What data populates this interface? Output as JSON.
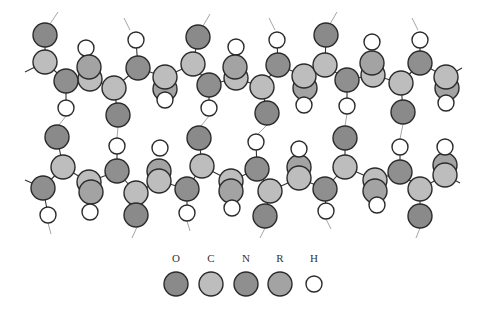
{
  "colors": {
    "O": "#8a8a8a",
    "C": "#bdbdbd",
    "N": "#8f8f8f",
    "R": "#a3a3a3",
    "H": "#ffffff",
    "stroke": "#2b2b2b",
    "bond": "#333333",
    "hbond": "#9a9a9a"
  },
  "legend": {
    "items": [
      {
        "label": "O",
        "x": 176,
        "type": "O"
      },
      {
        "label": "C",
        "x": 211,
        "type": "C"
      },
      {
        "label": "N",
        "x": 246,
        "type": "N"
      },
      {
        "label": "R",
        "x": 280,
        "type": "R"
      },
      {
        "label": "H",
        "x": 314,
        "type": "H"
      }
    ]
  },
  "chains": {
    "top": {
      "atoms": [
        {
          "t": "O",
          "x": 45,
          "y": 35,
          "r": 12
        },
        {
          "t": "C",
          "x": 45,
          "y": 62,
          "r": 12
        },
        {
          "t": "H",
          "x": 86,
          "y": 48,
          "r": 8
        },
        {
          "t": "C",
          "x": 90,
          "y": 79,
          "r": 12
        },
        {
          "t": "R",
          "x": 89,
          "y": 67,
          "r": 12
        },
        {
          "t": "N",
          "x": 66,
          "y": 81,
          "r": 12
        },
        {
          "t": "H",
          "x": 66,
          "y": 108,
          "r": 8
        },
        {
          "t": "C",
          "x": 114,
          "y": 88,
          "r": 12
        },
        {
          "t": "O",
          "x": 118,
          "y": 115,
          "r": 12
        },
        {
          "t": "H",
          "x": 136,
          "y": 40,
          "r": 8
        },
        {
          "t": "N",
          "x": 138,
          "y": 68,
          "r": 12
        },
        {
          "t": "R",
          "x": 165,
          "y": 89,
          "r": 12
        },
        {
          "t": "H",
          "x": 165,
          "y": 100,
          "r": 8
        },
        {
          "t": "C",
          "x": 165,
          "y": 77,
          "r": 12
        },
        {
          "t": "O",
          "x": 198,
          "y": 37,
          "r": 12
        },
        {
          "t": "C",
          "x": 193,
          "y": 64,
          "r": 12
        },
        {
          "t": "N",
          "x": 209,
          "y": 85,
          "r": 12
        },
        {
          "t": "H",
          "x": 209,
          "y": 108,
          "r": 8
        },
        {
          "t": "H",
          "x": 236,
          "y": 47,
          "r": 8
        },
        {
          "t": "C",
          "x": 236,
          "y": 78,
          "r": 12
        },
        {
          "t": "R",
          "x": 235,
          "y": 67,
          "r": 12
        },
        {
          "t": "C",
          "x": 262,
          "y": 87,
          "r": 12
        },
        {
          "t": "O",
          "x": 267,
          "y": 113,
          "r": 12
        },
        {
          "t": "H",
          "x": 277,
          "y": 40,
          "r": 8
        },
        {
          "t": "N",
          "x": 278,
          "y": 65,
          "r": 12
        },
        {
          "t": "R",
          "x": 305,
          "y": 88,
          "r": 12
        },
        {
          "t": "H",
          "x": 304,
          "y": 105,
          "r": 8
        },
        {
          "t": "C",
          "x": 304,
          "y": 76,
          "r": 12
        },
        {
          "t": "O",
          "x": 326,
          "y": 35,
          "r": 12
        },
        {
          "t": "C",
          "x": 325,
          "y": 65,
          "r": 12
        },
        {
          "t": "N",
          "x": 347,
          "y": 80,
          "r": 12
        },
        {
          "t": "H",
          "x": 347,
          "y": 106,
          "r": 8
        },
        {
          "t": "H",
          "x": 372,
          "y": 42,
          "r": 8
        },
        {
          "t": "C",
          "x": 373,
          "y": 75,
          "r": 12
        },
        {
          "t": "R",
          "x": 372,
          "y": 63,
          "r": 12
        },
        {
          "t": "C",
          "x": 401,
          "y": 83,
          "r": 12
        },
        {
          "t": "O",
          "x": 403,
          "y": 112,
          "r": 12
        },
        {
          "t": "H",
          "x": 420,
          "y": 40,
          "r": 8
        },
        {
          "t": "N",
          "x": 420,
          "y": 63,
          "r": 12
        },
        {
          "t": "R",
          "x": 447,
          "y": 88,
          "r": 12
        },
        {
          "t": "H",
          "x": 446,
          "y": 103,
          "r": 8
        },
        {
          "t": "C",
          "x": 446,
          "y": 77,
          "r": 12
        }
      ],
      "bonds": [
        [
          25,
          72,
          45,
          62
        ],
        [
          45,
          62,
          66,
          81
        ],
        [
          66,
          81,
          90,
          79
        ],
        [
          90,
          79,
          114,
          88
        ],
        [
          114,
          88,
          138,
          68
        ],
        [
          138,
          68,
          165,
          77
        ],
        [
          165,
          77,
          193,
          64
        ],
        [
          193,
          64,
          209,
          85
        ],
        [
          209,
          85,
          236,
          78
        ],
        [
          236,
          78,
          262,
          87
        ],
        [
          262,
          87,
          278,
          65
        ],
        [
          278,
          65,
          304,
          76
        ],
        [
          304,
          76,
          325,
          65
        ],
        [
          325,
          65,
          347,
          80
        ],
        [
          347,
          80,
          373,
          75
        ],
        [
          373,
          75,
          401,
          83
        ],
        [
          401,
          83,
          420,
          63
        ],
        [
          420,
          63,
          446,
          77
        ],
        [
          446,
          77,
          462,
          68
        ],
        [
          45,
          35,
          45,
          62
        ],
        [
          66,
          81,
          66,
          108
        ],
        [
          114,
          88,
          118,
          115
        ],
        [
          138,
          68,
          136,
          40
        ],
        [
          193,
          64,
          198,
          37
        ],
        [
          209,
          85,
          209,
          108
        ],
        [
          262,
          87,
          267,
          113
        ],
        [
          278,
          65,
          277,
          40
        ],
        [
          325,
          65,
          326,
          35
        ],
        [
          347,
          80,
          347,
          106
        ],
        [
          401,
          83,
          403,
          112
        ],
        [
          420,
          63,
          420,
          40
        ]
      ]
    },
    "bottom": {
      "atoms": [
        {
          "t": "O",
          "x": 57,
          "y": 137,
          "r": 12
        },
        {
          "t": "C",
          "x": 63,
          "y": 167,
          "r": 12
        },
        {
          "t": "N",
          "x": 43,
          "y": 188,
          "r": 12
        },
        {
          "t": "H",
          "x": 48,
          "y": 215,
          "r": 8
        },
        {
          "t": "C",
          "x": 89,
          "y": 182,
          "r": 12
        },
        {
          "t": "R",
          "x": 91,
          "y": 192,
          "r": 12
        },
        {
          "t": "H",
          "x": 90,
          "y": 212,
          "r": 8
        },
        {
          "t": "H",
          "x": 117,
          "y": 146,
          "r": 8
        },
        {
          "t": "N",
          "x": 117,
          "y": 171,
          "r": 12
        },
        {
          "t": "C",
          "x": 136,
          "y": 193,
          "r": 12
        },
        {
          "t": "O",
          "x": 136,
          "y": 215,
          "r": 12
        },
        {
          "t": "R",
          "x": 159,
          "y": 171,
          "r": 12
        },
        {
          "t": "H",
          "x": 160,
          "y": 148,
          "r": 8
        },
        {
          "t": "C",
          "x": 159,
          "y": 181,
          "r": 12
        },
        {
          "t": "O",
          "x": 199,
          "y": 138,
          "r": 12
        },
        {
          "t": "C",
          "x": 202,
          "y": 166,
          "r": 12
        },
        {
          "t": "N",
          "x": 187,
          "y": 189,
          "r": 12
        },
        {
          "t": "H",
          "x": 187,
          "y": 213,
          "r": 8
        },
        {
          "t": "C",
          "x": 231,
          "y": 181,
          "r": 12
        },
        {
          "t": "R",
          "x": 231,
          "y": 191,
          "r": 12
        },
        {
          "t": "H",
          "x": 232,
          "y": 208,
          "r": 8
        },
        {
          "t": "H",
          "x": 256,
          "y": 142,
          "r": 8
        },
        {
          "t": "N",
          "x": 257,
          "y": 169,
          "r": 12
        },
        {
          "t": "C",
          "x": 270,
          "y": 191,
          "r": 12
        },
        {
          "t": "O",
          "x": 265,
          "y": 216,
          "r": 12
        },
        {
          "t": "R",
          "x": 299,
          "y": 167,
          "r": 12
        },
        {
          "t": "H",
          "x": 299,
          "y": 149,
          "r": 8
        },
        {
          "t": "C",
          "x": 299,
          "y": 178,
          "r": 12
        },
        {
          "t": "O",
          "x": 345,
          "y": 138,
          "r": 12
        },
        {
          "t": "C",
          "x": 345,
          "y": 167,
          "r": 12
        },
        {
          "t": "N",
          "x": 325,
          "y": 189,
          "r": 12
        },
        {
          "t": "H",
          "x": 326,
          "y": 211,
          "r": 8
        },
        {
          "t": "C",
          "x": 375,
          "y": 180,
          "r": 12
        },
        {
          "t": "R",
          "x": 375,
          "y": 191,
          "r": 12
        },
        {
          "t": "H",
          "x": 377,
          "y": 205,
          "r": 8
        },
        {
          "t": "H",
          "x": 400,
          "y": 147,
          "r": 8
        },
        {
          "t": "N",
          "x": 400,
          "y": 172,
          "r": 12
        },
        {
          "t": "C",
          "x": 420,
          "y": 189,
          "r": 12
        },
        {
          "t": "O",
          "x": 420,
          "y": 216,
          "r": 12
        },
        {
          "t": "R",
          "x": 445,
          "y": 165,
          "r": 12
        },
        {
          "t": "H",
          "x": 445,
          "y": 147,
          "r": 8
        },
        {
          "t": "C",
          "x": 445,
          "y": 175,
          "r": 12
        }
      ],
      "bonds": [
        [
          25,
          180,
          43,
          188
        ],
        [
          43,
          188,
          63,
          167
        ],
        [
          63,
          167,
          89,
          182
        ],
        [
          89,
          182,
          117,
          171
        ],
        [
          117,
          171,
          136,
          193
        ],
        [
          136,
          193,
          159,
          181
        ],
        [
          159,
          181,
          187,
          189
        ],
        [
          187,
          189,
          202,
          166
        ],
        [
          202,
          166,
          231,
          181
        ],
        [
          231,
          181,
          257,
          169
        ],
        [
          257,
          169,
          270,
          191
        ],
        [
          270,
          191,
          299,
          178
        ],
        [
          299,
          178,
          325,
          189
        ],
        [
          325,
          189,
          345,
          167
        ],
        [
          345,
          167,
          375,
          180
        ],
        [
          375,
          180,
          400,
          172
        ],
        [
          400,
          172,
          420,
          189
        ],
        [
          420,
          189,
          445,
          175
        ],
        [
          445,
          175,
          460,
          183
        ],
        [
          57,
          137,
          63,
          167
        ],
        [
          43,
          188,
          48,
          215
        ],
        [
          117,
          171,
          117,
          146
        ],
        [
          136,
          193,
          136,
          215
        ],
        [
          199,
          138,
          202,
          166
        ],
        [
          187,
          189,
          187,
          213
        ],
        [
          257,
          169,
          256,
          142
        ],
        [
          270,
          191,
          265,
          216
        ],
        [
          345,
          138,
          345,
          167
        ],
        [
          325,
          189,
          326,
          211
        ],
        [
          400,
          172,
          400,
          147
        ],
        [
          420,
          189,
          420,
          216
        ]
      ]
    }
  },
  "hbonds": [
    [
      50,
      24,
      58,
      12
    ],
    [
      130,
      30,
      124,
      18
    ],
    [
      203,
      26,
      210,
      14
    ],
    [
      275,
      30,
      269,
      18
    ],
    [
      330,
      24,
      337,
      12
    ],
    [
      418,
      30,
      412,
      18
    ],
    [
      66,
      116,
      59,
      125
    ],
    [
      118,
      127,
      117,
      138
    ],
    [
      209,
      116,
      201,
      126
    ],
    [
      267,
      125,
      258,
      134
    ],
    [
      347,
      114,
      345,
      126
    ],
    [
      403,
      124,
      400,
      139
    ],
    [
      48,
      223,
      51,
      234
    ],
    [
      137,
      227,
      132,
      238
    ],
    [
      187,
      221,
      190,
      231
    ],
    [
      265,
      228,
      260,
      238
    ],
    [
      326,
      219,
      331,
      229
    ],
    [
      420,
      228,
      416,
      238
    ]
  ]
}
